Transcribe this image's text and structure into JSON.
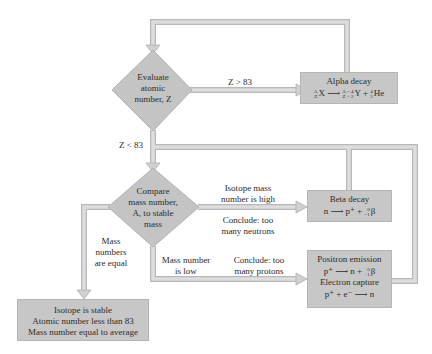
{
  "diagram": {
    "type": "flowchart",
    "colors": {
      "box_fill": "#c7c7c7",
      "diamond_fill": "#c4c4c4",
      "pipe_fill": "#dcdcdc",
      "pipe_edge": "#b8b8b8"
    },
    "decisions": {
      "evaluate": {
        "line1": "Evaluate",
        "line2": "atomic",
        "line3": "number, Z"
      },
      "compare": {
        "line1": "Compare",
        "line2": "mass number,",
        "line3": "A, to stable",
        "line4": "mass"
      }
    },
    "edge_labels": {
      "z_gt": "Z > 83",
      "z_lt": "Z < 83",
      "high_1": "Isotope mass",
      "high_2": "number is high",
      "neutrons_1": "Conclude: too",
      "neutrons_2": "many neutrons",
      "equal_1": "Mass",
      "equal_2": "numbers",
      "equal_3": "are equal",
      "low_1": "Mass number",
      "low_2": "is low",
      "protons_1": "Conclude: too",
      "protons_2": "many protons"
    },
    "outcomes": {
      "alpha": {
        "title": "Alpha decay",
        "eq_left": "X",
        "eq_left_mass": "A",
        "eq_left_z": "Z",
        "eq_arrow": "⟶",
        "eq_y": "Y",
        "eq_y_mass": "A − 4",
        "eq_y_z": "Z − 2",
        "eq_plus": "+",
        "eq_he": "He",
        "eq_he_mass": "4",
        "eq_he_z": "2"
      },
      "beta": {
        "title": "Beta decay",
        "eq": "n ⟶ p⁺ +",
        "eq_particle": "β",
        "eq_mass": "0",
        "eq_z": "−1"
      },
      "positron": {
        "title": "Positron emission",
        "eq": "p⁺ ⟶ n +",
        "eq_particle": "β",
        "eq_mass": "0",
        "eq_z": "+1"
      },
      "capture": {
        "title": "Electron capture",
        "eq": "p⁺ + e⁻ ⟶ n"
      },
      "stable": {
        "line1": "Isotope is stable",
        "line2": "Atomic number less than 83",
        "line3": "Mass number equal to average"
      }
    }
  }
}
